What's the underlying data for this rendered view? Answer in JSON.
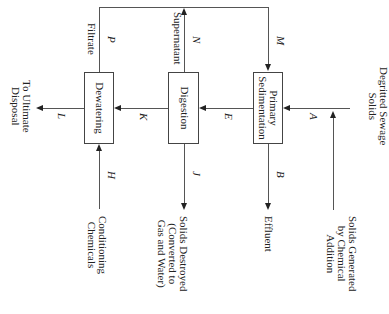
{
  "diagram": {
    "orientation": "rotated 90 degrees clockwise",
    "processes": [
      {
        "id": "primary-sedimentation",
        "label_line1": "Primary",
        "label_line2": "Sedimentation"
      },
      {
        "id": "digestion",
        "label": "Digestion"
      },
      {
        "id": "dewatering",
        "label": "Dewatering"
      }
    ],
    "inputs": {
      "degritted": {
        "line1": "Degritted Sewage",
        "line2": "Solids"
      },
      "chemical": {
        "line1": "Solids Generated",
        "line2": "by Chemical",
        "line3": "Addition"
      },
      "conditioning": {
        "line1": "Conditioning",
        "line2": "Chemicals"
      }
    },
    "outputs": {
      "effluent": "Effluent",
      "destroyed": {
        "line1": "Solids Destroyed",
        "line2": "(Converted to",
        "line3": "Gas and Water)"
      },
      "disposal": {
        "line1": "To Ultimate",
        "line2": "Disposal"
      }
    },
    "recycle_labels": {
      "supernatant": "Supernatant",
      "filtrate": "Filtrate"
    },
    "stream_labels": {
      "A": "A",
      "B": "B",
      "E": "E",
      "H": "H",
      "J": "J",
      "K": "K",
      "L": "L",
      "M": "M",
      "N": "N",
      "P": "P"
    }
  }
}
